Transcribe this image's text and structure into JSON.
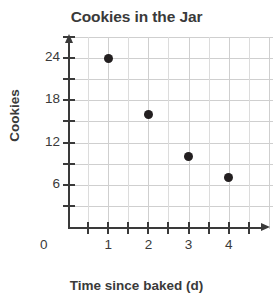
{
  "chart_data": {
    "type": "scatter",
    "title": "Cookies in the Jar",
    "xlabel": "Time since baked (d)",
    "ylabel": "Cookies",
    "x": [
      1,
      2,
      3,
      4
    ],
    "values": [
      24,
      16,
      10,
      7
    ],
    "points": [
      {
        "x": 1,
        "y": 24
      },
      {
        "x": 2,
        "y": 16
      },
      {
        "x": 3,
        "y": 10
      },
      {
        "x": 4,
        "y": 7
      }
    ],
    "xlim": [
      0,
      5.1
    ],
    "ylim": [
      0,
      27
    ],
    "x_tick_labels": [
      "1",
      "2",
      "3",
      "4"
    ],
    "x_tick_values": [
      1,
      2,
      3,
      4
    ],
    "x_minor_step": 0.5,
    "y_tick_labels": [
      "6",
      "12",
      "18",
      "24"
    ],
    "y_tick_values": [
      6,
      12,
      18,
      24
    ],
    "y_minor_step": 3,
    "origin_label": "0",
    "grid": true,
    "grid_color": "#cfcfcf",
    "legend": null,
    "marker_color": "#231f20",
    "axis_color": "#3a3a3a",
    "background_color": "#ffffff"
  }
}
